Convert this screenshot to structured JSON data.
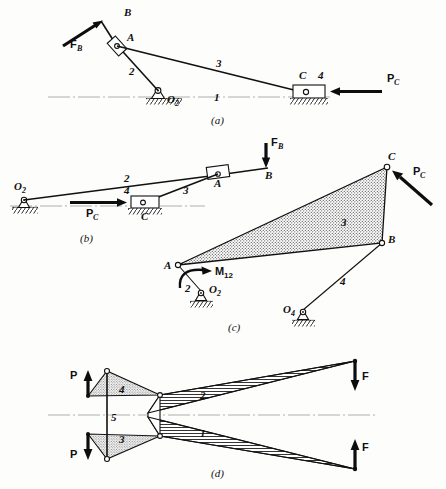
{
  "figure": {
    "background_color": "#fdfdfc",
    "ink_color": "#111111"
  },
  "panels": [
    {
      "id": "a",
      "caption": "(a)",
      "description": "Inverted slider-crank: crank 2 pivoted at O2, slider block at A on link 2, coupler 3 to slider 4 at C on horizontal ground line 1",
      "labels": {
        "point_B": "B",
        "point_A": "A",
        "point_C": "C",
        "pivot_O2": "O",
        "pivot_O2_sub": "2",
        "link_1": "1",
        "link_2": "2",
        "link_3": "3",
        "link_4": "4",
        "force_FB": "F",
        "force_FB_sub": "B",
        "force_PC": "P",
        "force_PC_sub": "C"
      }
    },
    {
      "id": "b",
      "caption": "(b)",
      "description": "Same mechanism re-drawn in a stretched configuration: O2 at left, slider C on ground, link 2 up to slider block A, link 3 from C to A, force FB down at B",
      "labels": {
        "point_A": "A",
        "point_B": "B",
        "point_C": "C",
        "pivot_O2": "O",
        "pivot_O2_sub": "2",
        "link_2": "2",
        "link_3": "3",
        "link_4": "4",
        "force_FB": "F",
        "force_FB_sub": "B",
        "force_PC": "P",
        "force_PC_sub": "C"
      }
    },
    {
      "id": "c",
      "caption": "(c)",
      "description": "Four-bar with shaded ternary coupler link 3 (A-B-C); crank 2 from O2 to A driven by moment M12; link 4 from O4 to B; force PC applied at C",
      "labels": {
        "point_A": "A",
        "point_B": "B",
        "point_C": "C",
        "pivot_O2": "O",
        "pivot_O2_sub": "2",
        "pivot_O4": "O",
        "pivot_O4_sub": "4",
        "link_2": "2",
        "link_3": "3",
        "link_4": "4",
        "moment_M12": "M",
        "moment_M12_sub": "12",
        "force_PC": "P",
        "force_PC_sub": "C"
      }
    },
    {
      "id": "d",
      "caption": "(d)",
      "description": "Symmetric toggle / straight-line mechanism: input forces P at left on links 4 and 3, output forces F at right on hatched links 2 and 1, vertical link 5 at center-left",
      "labels": {
        "link_1": "1",
        "link_2": "2",
        "link_3": "3",
        "link_4": "4",
        "link_5": "5",
        "force_P_top": "P",
        "force_P_bottom": "P",
        "force_F_top": "F",
        "force_F_bottom": "F"
      }
    }
  ]
}
